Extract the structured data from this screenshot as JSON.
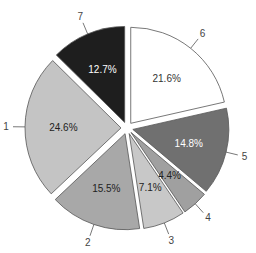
{
  "chart_data": {
    "type": "pie",
    "title": "",
    "start_angle_deg": 90,
    "direction": "clockwise",
    "exploded": true,
    "slices": [
      {
        "label": "6",
        "value": 21.6,
        "text": "21.6%",
        "color": "#ffffff",
        "text_color": "#333333"
      },
      {
        "label": "5",
        "value": 14.8,
        "text": "14.8%",
        "color": "#707070",
        "text_color": "#ffffff"
      },
      {
        "label": "4",
        "value": 4.4,
        "text": "4.4%",
        "color": "#a0a0a0",
        "text_color": "#222222"
      },
      {
        "label": "3",
        "value": 7.1,
        "text": "7.1%",
        "color": "#c8c8c8",
        "text_color": "#222222"
      },
      {
        "label": "2",
        "value": 15.5,
        "text": "15.5%",
        "color": "#a8a8a8",
        "text_color": "#222222"
      },
      {
        "label": "1",
        "value": 24.6,
        "text": "24.6%",
        "color": "#c4c4c4",
        "text_color": "#222222"
      },
      {
        "label": "7",
        "value": 12.7,
        "text": "12.7%",
        "color": "#1e1e1e",
        "text_color": "#ffffff"
      }
    ],
    "categories": [
      "1",
      "2",
      "3",
      "4",
      "5",
      "6",
      "7"
    ],
    "values": [
      24.6,
      15.5,
      7.1,
      4.4,
      14.8,
      21.6,
      12.7
    ]
  }
}
